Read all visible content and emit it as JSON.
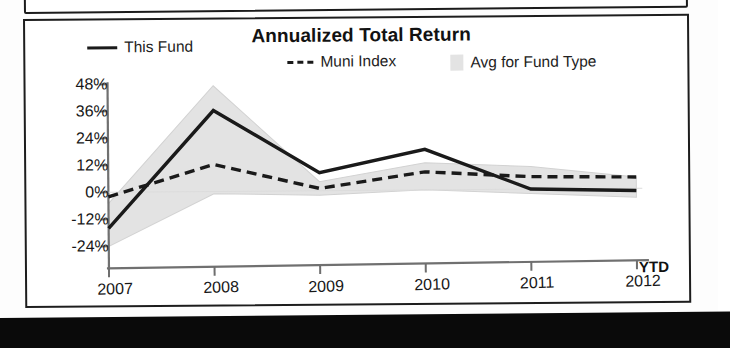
{
  "chart_panel": {
    "title": "Annualized Total Return",
    "ytd_note": "YTD",
    "legend": [
      {
        "key": "this-fund",
        "label": "This Fund",
        "marker": "solid-line",
        "color": "#1a1a1a"
      },
      {
        "key": "muni-index",
        "label": "Muni Index",
        "marker": "dashed-line",
        "color": "#1a1a1a"
      },
      {
        "key": "avg-fund",
        "label": "Avg for Fund Type",
        "marker": "filled-box",
        "color": "#e3e3e3"
      }
    ]
  },
  "chart_data": {
    "type": "line",
    "title": "Annualized Total Return",
    "xlabel": "",
    "ylabel": "",
    "categories": [
      "2007",
      "2008",
      "2009",
      "2010",
      "2011",
      "2012"
    ],
    "x_note": "YTD",
    "ytick_labels": [
      "48%",
      "36%",
      "24%",
      "12%",
      "0%",
      "-12%",
      "-24%"
    ],
    "ytick_values": [
      48,
      36,
      24,
      12,
      0,
      -12,
      -24
    ],
    "ylim": [
      -24,
      48
    ],
    "grid": false,
    "legend_position": "top",
    "series": [
      {
        "name": "This Fund",
        "style": "solid",
        "color": "#1a1a1a",
        "values": [
          -16,
          36,
          8,
          18,
          0,
          -1
        ]
      },
      {
        "name": "Muni Index",
        "style": "dashed",
        "color": "#1a1a1a",
        "values": [
          -2,
          12,
          1,
          8,
          5.5,
          5
        ]
      }
    ],
    "band": {
      "name": "Avg for Fund Type",
      "color": "#e3e3e3",
      "upper": [
        -5,
        47,
        4,
        12,
        10,
        5
      ],
      "lower": [
        -24,
        -1,
        -2,
        0,
        -2,
        -4
      ]
    }
  }
}
